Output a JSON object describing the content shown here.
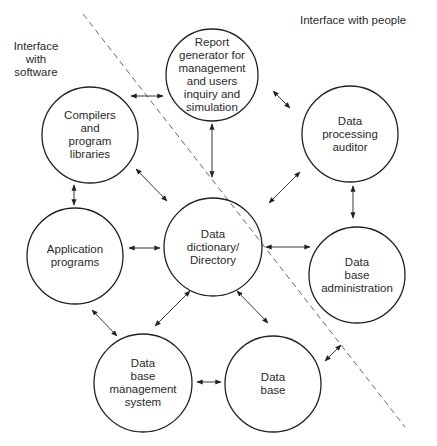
{
  "labels": {
    "software_zone": "Interface\nwith\nsoftware",
    "people_zone": "Interface with people"
  },
  "nodes": [
    {
      "id": "report",
      "text": "Report\ngenerator for\nmanagement\nand users\ninquiry and\nsimulation",
      "cx": 212,
      "cy": 75,
      "r": 46
    },
    {
      "id": "compilers",
      "text": "Compilers\nand\nprogram\nlibraries",
      "cx": 90,
      "cy": 135,
      "r": 48
    },
    {
      "id": "auditor",
      "text": "Data\nprocessing\nauditor",
      "cx": 350,
      "cy": 134,
      "r": 48
    },
    {
      "id": "application",
      "text": "Application\nprograms",
      "cx": 75,
      "cy": 256,
      "r": 48
    },
    {
      "id": "dictionary",
      "text": "Data\ndictionary/\nDirectory",
      "cx": 213,
      "cy": 247,
      "r": 49
    },
    {
      "id": "dba",
      "text": "Data\nbase\nadministration",
      "cx": 357,
      "cy": 275,
      "r": 48
    },
    {
      "id": "dbms",
      "text": "Data\nbase\nmanagement\nsystem",
      "cx": 143,
      "cy": 383,
      "r": 49
    },
    {
      "id": "database",
      "text": "Data\nbase",
      "cx": 273,
      "cy": 384,
      "r": 48
    }
  ],
  "edges": [
    {
      "from": "compilers",
      "to": "report",
      "type": "bidirectional"
    },
    {
      "from": "report",
      "to": "auditor",
      "type": "bidirectional"
    },
    {
      "from": "compilers",
      "to": "application",
      "type": "bidirectional"
    },
    {
      "from": "compilers",
      "to": "dictionary",
      "type": "bidirectional"
    },
    {
      "from": "report",
      "to": "dictionary",
      "type": "bidirectional"
    },
    {
      "from": "auditor",
      "to": "dictionary",
      "type": "bidirectional"
    },
    {
      "from": "auditor",
      "to": "dba",
      "type": "bidirectional"
    },
    {
      "from": "application",
      "to": "dictionary",
      "type": "bidirectional"
    },
    {
      "from": "dictionary",
      "to": "dba",
      "type": "bidirectional"
    },
    {
      "from": "application",
      "to": "dbms",
      "type": "bidirectional"
    },
    {
      "from": "dictionary",
      "to": "dbms",
      "type": "bidirectional"
    },
    {
      "from": "dictionary",
      "to": "database",
      "type": "bidirectional"
    },
    {
      "from": "dbms",
      "to": "database",
      "type": "bidirectional"
    },
    {
      "from": "database",
      "to": "dba",
      "type": "bidirectional"
    }
  ],
  "boundary": {
    "style": "dashed",
    "from": [
      83,
      14
    ],
    "to": [
      405,
      427
    ]
  }
}
